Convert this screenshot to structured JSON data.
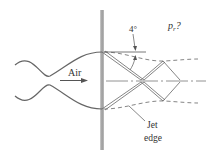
{
  "diagram": {
    "labels": {
      "pressure": "p",
      "pressure_sub": "r",
      "pressure_q": "?",
      "angle": "4°",
      "flow": "Air",
      "jet_line1": "Jet",
      "jet_line2": "edge"
    },
    "colors": {
      "line": "#555555",
      "wall": "#888888",
      "text": "#333333"
    }
  }
}
